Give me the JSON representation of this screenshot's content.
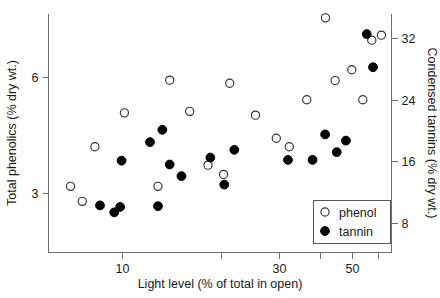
{
  "chart_data": {
    "type": "scatter",
    "title": "",
    "xlabel": "Light level (% of total in open)",
    "ylabel": "Total phenolics (% dry wt.)",
    "y2label": "Condensed tannins (% dry wt.)",
    "grid": false,
    "legend_position": "bottom-right",
    "xscale": "log",
    "xlim": [
      6,
      66
    ],
    "ylim": [
      1.45,
      7.65
    ],
    "y2lim": [
      4.2,
      35.1
    ],
    "xticks": [
      10,
      20,
      30,
      40,
      50,
      60
    ],
    "xtick_labels": [
      "10",
      "",
      "30",
      "",
      "50",
      ""
    ],
    "yticks": [
      3,
      6
    ],
    "ytick_labels": [
      "3",
      "6"
    ],
    "y2ticks": [
      8,
      16,
      24,
      32
    ],
    "y2tick_labels": [
      "8",
      "16",
      "24",
      "32"
    ],
    "series": [
      {
        "name": "phenol",
        "marker": "open-circle",
        "color": "#ffffff",
        "edge_color": "#333333",
        "axis": "left",
        "points": [
          {
            "x": 7.0,
            "y": 3.17
          },
          {
            "x": 7.6,
            "y": 2.78
          },
          {
            "x": 8.3,
            "y": 4.2
          },
          {
            "x": 10.2,
            "y": 5.08
          },
          {
            "x": 12.9,
            "y": 3.17
          },
          {
            "x": 14.0,
            "y": 5.93
          },
          {
            "x": 16.1,
            "y": 5.12
          },
          {
            "x": 18.3,
            "y": 3.72
          },
          {
            "x": 20.4,
            "y": 3.48
          },
          {
            "x": 21.3,
            "y": 5.85
          },
          {
            "x": 25.5,
            "y": 5.02
          },
          {
            "x": 29.5,
            "y": 4.42
          },
          {
            "x": 32.3,
            "y": 4.2
          },
          {
            "x": 36.5,
            "y": 5.42
          },
          {
            "x": 41.6,
            "y": 7.55
          },
          {
            "x": 44.5,
            "y": 5.92
          },
          {
            "x": 50.0,
            "y": 6.2
          },
          {
            "x": 54.0,
            "y": 5.42
          },
          {
            "x": 57.5,
            "y": 6.97
          },
          {
            "x": 61.5,
            "y": 7.1
          }
        ]
      },
      {
        "name": "tannin",
        "marker": "filled-circle",
        "color": "#000000",
        "edge_color": "#000000",
        "axis": "right",
        "points": [
          {
            "x": 8.6,
            "y": 10.3
          },
          {
            "x": 9.5,
            "y": 9.4
          },
          {
            "x": 9.9,
            "y": 10.1
          },
          {
            "x": 10.0,
            "y": 16.1
          },
          {
            "x": 12.2,
            "y": 18.5
          },
          {
            "x": 12.9,
            "y": 10.2
          },
          {
            "x": 13.3,
            "y": 20.1
          },
          {
            "x": 14.0,
            "y": 15.6
          },
          {
            "x": 15.2,
            "y": 14.1
          },
          {
            "x": 18.6,
            "y": 16.5
          },
          {
            "x": 20.5,
            "y": 13.0
          },
          {
            "x": 22.0,
            "y": 17.5
          },
          {
            "x": 32.0,
            "y": 16.2
          },
          {
            "x": 38.0,
            "y": 16.2
          },
          {
            "x": 41.5,
            "y": 19.5
          },
          {
            "x": 45.0,
            "y": 17.2
          },
          {
            "x": 48.0,
            "y": 18.7
          },
          {
            "x": 55.5,
            "y": 32.5
          },
          {
            "x": 58.0,
            "y": 28.2
          }
        ]
      }
    ]
  },
  "legend": {
    "entries": [
      {
        "label": "phenol",
        "marker": "open-circle"
      },
      {
        "label": "tannin",
        "marker": "filled-circle"
      }
    ]
  }
}
